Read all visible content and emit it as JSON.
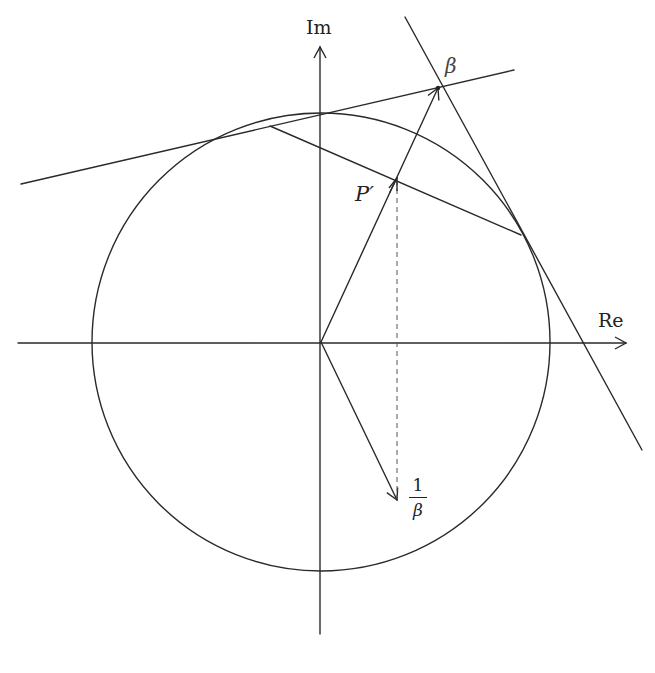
{
  "figure": {
    "labels": {
      "imag_axis": "Im",
      "real_axis": "Re",
      "beta": "β",
      "p_prime": "P′",
      "inv_beta_num": "1",
      "inv_beta_den": "β"
    },
    "colors": {
      "stroke": "#2a2a2a",
      "background": "#ffffff"
    },
    "geometry": {
      "origin": [
        321,
        342
      ],
      "circle_radius": 229,
      "beta_point": [
        438,
        87
      ],
      "p_prime_point": [
        397,
        178
      ],
      "inv_beta_point": [
        397,
        500
      ],
      "tangent_point_upper": [
        270,
        126
      ],
      "tangent_point_right": [
        521,
        235
      ]
    }
  }
}
